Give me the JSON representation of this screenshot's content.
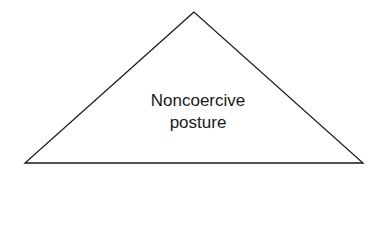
{
  "diagram": {
    "shape": "triangle",
    "stroke_color": "#1a1a1a",
    "label_lines": [
      "Noncoercive",
      "posture"
    ]
  }
}
